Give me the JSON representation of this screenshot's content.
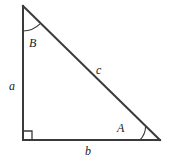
{
  "figure": {
    "kind": "right-triangle-diagram",
    "background_color": "#ffffff",
    "stroke_color": "#3a3a3a",
    "text_color": "#1a1a1a",
    "stroke_width": 2,
    "arc_stroke_width": 1
  },
  "vertices": {
    "top": {
      "name": "top-vertex",
      "x": 23,
      "y": 6
    },
    "bottom_left": {
      "name": "right-angle-vertex",
      "x": 23,
      "y": 140
    },
    "bottom_right": {
      "name": "bottom-right-vertex",
      "x": 160,
      "y": 140
    }
  },
  "sides": [
    {
      "id": "a",
      "label": "a",
      "name": "side-a-vertical-leg",
      "from": "top",
      "to": "bottom_left"
    },
    {
      "id": "b",
      "label": "b",
      "name": "side-b-horizontal-leg",
      "from": "bottom_left",
      "to": "bottom_right"
    },
    {
      "id": "c",
      "label": "c",
      "name": "side-c-hypotenuse",
      "from": "top",
      "to": "bottom_right"
    }
  ],
  "angles": [
    {
      "id": "A",
      "label": "A",
      "name": "angle-A",
      "at": "bottom_right",
      "arc_radius": 20
    },
    {
      "id": "B",
      "label": "B",
      "name": "angle-B",
      "at": "top",
      "arc_radius": 25
    },
    {
      "id": "right",
      "label": "",
      "name": "right-angle-marker",
      "at": "bottom_left",
      "marker_size": 9
    }
  ]
}
